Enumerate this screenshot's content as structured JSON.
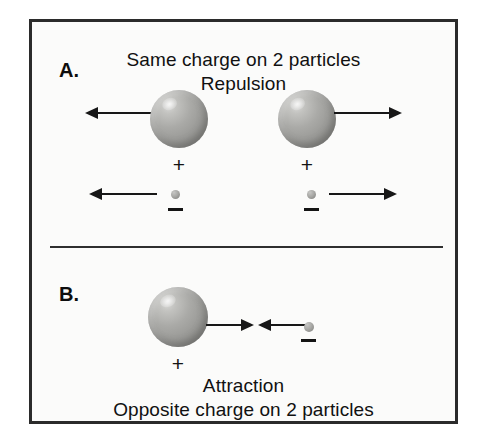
{
  "figure": {
    "title_top_line1": "Same charge on 2 particles",
    "title_top_line2": "Repulsion",
    "title_bottom_line1": "Attraction",
    "title_bottom_line2": "Opposite charge on 2 particles",
    "background_color": "#fbfbfa",
    "frame_color": "#2b2b2b",
    "ink_color": "#141414",
    "sphere_color": "#9b9b98",
    "particle_color": "#a9a9a6"
  },
  "panels": [
    {
      "id": "A",
      "label": "A.",
      "heading_line1": "Same charge on 2 particles",
      "heading_line2": "Repulsion",
      "interaction": "Repulsion",
      "objects": [
        {
          "name": "large-sphere-left",
          "charge_sign": "+",
          "size": "large",
          "force_arrow": "left"
        },
        {
          "name": "large-sphere-right",
          "charge_sign": "+",
          "size": "large",
          "force_arrow": "right"
        },
        {
          "name": "small-particle-left",
          "charge_sign": "−",
          "size": "small",
          "force_arrow": "left"
        },
        {
          "name": "small-particle-right",
          "charge_sign": "−",
          "size": "small",
          "force_arrow": "right"
        }
      ]
    },
    {
      "id": "B",
      "label": "B.",
      "heading_line1": "Attraction",
      "heading_line2": "Opposite charge on 2 particles",
      "interaction": "Attraction",
      "objects": [
        {
          "name": "large-sphere",
          "charge_sign": "+",
          "size": "large",
          "force_arrow": "right"
        },
        {
          "name": "small-particle",
          "charge_sign": "−",
          "size": "small",
          "force_arrow": "left"
        }
      ]
    }
  ],
  "signs": {
    "plus": "+",
    "minus": "−"
  }
}
